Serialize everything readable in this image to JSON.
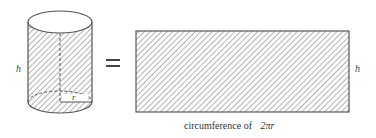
{
  "diagram": {
    "cylinder": {
      "height_label": "h",
      "radius_label": "r"
    },
    "equals_symbol": "=",
    "rectangle": {
      "height_label": "h",
      "width_caption_prefix": "circumference of",
      "width_caption_formula": "2πr"
    },
    "colors": {
      "stroke": "#555555",
      "hatch": "#666666",
      "background": "#ffffff"
    }
  }
}
